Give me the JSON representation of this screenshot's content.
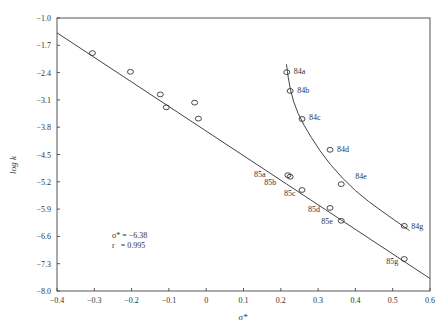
{
  "chart_data": {
    "type": "scatter",
    "title": "",
    "xlabel": "σ*",
    "ylabel": "log k",
    "xlim": [
      -0.4,
      0.6
    ],
    "ylim": [
      -8.0,
      -1.0
    ],
    "grid": false,
    "x_ticks": [
      "-0.4",
      "-0.3",
      "-0.2",
      "-0.1",
      "0",
      "0.1",
      "0.2",
      "0.3",
      "0.4",
      "0.5",
      "0.6"
    ],
    "y_ticks": [
      "-1.0",
      "-1.7",
      "-2.4",
      "-3.1",
      "-3.8",
      "-4.5",
      "-5.2",
      "-5.9",
      "-6.6",
      "-7.3",
      "-8.0"
    ],
    "annotation": {
      "line1": "σ* = −6.38",
      "line2": "r   = 0.995"
    },
    "series": [
      {
        "name": "linear correlation (85 series and others)",
        "kind": "points",
        "points": [
          {
            "x": -0.305,
            "y": -1.9,
            "label": ""
          },
          {
            "x": -0.203,
            "y": -2.38,
            "label": ""
          },
          {
            "x": -0.123,
            "y": -2.96,
            "label": ""
          },
          {
            "x": -0.107,
            "y": -3.29,
            "label": ""
          },
          {
            "x": -0.031,
            "y": -3.17,
            "label": ""
          },
          {
            "x": -0.021,
            "y": -3.58,
            "label": ""
          },
          {
            "x": 0.219,
            "y": -5.03,
            "label": "85a"
          },
          {
            "x": 0.225,
            "y": -5.07,
            "label": "85b"
          },
          {
            "x": 0.257,
            "y": -5.41,
            "label": "85c"
          },
          {
            "x": 0.332,
            "y": -5.87,
            "label": "85d"
          },
          {
            "x": 0.362,
            "y": -6.2,
            "label": "85e"
          },
          {
            "x": 0.531,
            "y": -7.18,
            "label": "85g"
          }
        ]
      },
      {
        "name": "curve (84 series)",
        "kind": "points",
        "points": [
          {
            "x": 0.216,
            "y": -2.39,
            "label": "84a"
          },
          {
            "x": 0.225,
            "y": -2.87,
            "label": "84b"
          },
          {
            "x": 0.257,
            "y": -3.59,
            "label": "84c"
          },
          {
            "x": 0.332,
            "y": -4.38,
            "label": "84d"
          },
          {
            "x": 0.362,
            "y": -5.26,
            "label": "84e"
          },
          {
            "x": 0.531,
            "y": -6.33,
            "label": "84g"
          }
        ]
      },
      {
        "name": "regression line",
        "kind": "line",
        "points": [
          {
            "x": -0.4,
            "y": -1.38
          },
          {
            "x": 0.6,
            "y": -7.68
          }
        ]
      },
      {
        "name": "84 series fitted curve",
        "kind": "curve",
        "points": [
          {
            "x": 0.215,
            "y": -2.18
          },
          {
            "x": 0.225,
            "y": -2.87
          },
          {
            "x": 0.245,
            "y": -3.45
          },
          {
            "x": 0.28,
            "y": -4.05
          },
          {
            "x": 0.33,
            "y": -4.75
          },
          {
            "x": 0.4,
            "y": -5.45
          },
          {
            "x": 0.47,
            "y": -5.95
          },
          {
            "x": 0.545,
            "y": -6.45
          }
        ]
      }
    ]
  }
}
